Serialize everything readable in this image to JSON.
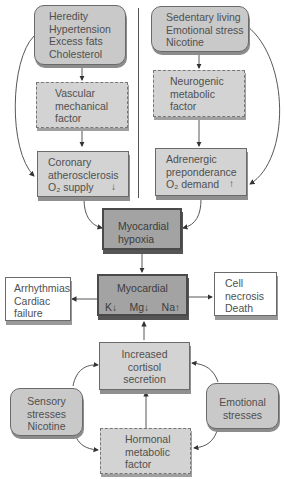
{
  "diagram": {
    "nodes": {
      "heredity": {
        "label": "Heredity\nHypertension\nExcess fats\nCholesterol",
        "style": "rounded"
      },
      "sedentary": {
        "label": "Sedentary living\nEmotional stress\nNicotine",
        "style": "rounded"
      },
      "vascular": {
        "label": "Vascular\nmechanical\nfactor",
        "style": "dashed"
      },
      "neurogenic": {
        "label": "Neurogenic\nmetabolic\nfactor",
        "style": "dashed"
      },
      "coronary": {
        "label": "Coronary\natherosclerosis",
        "line3": "O₂ supply",
        "arrow": "↓",
        "style": "solid"
      },
      "adrenergic": {
        "label": "Adrenergic\npreponderance",
        "line3": "O₂ demand",
        "arrow": "↑",
        "style": "solid"
      },
      "hypoxia": {
        "label": "Myocardial\nhypoxia",
        "style": "dark"
      },
      "myocardial": {
        "label": "Myocardial",
        "ions": [
          {
            "ion": "K",
            "arrow": "↓"
          },
          {
            "ion": "Mg",
            "arrow": "↓"
          },
          {
            "ion": "Na",
            "arrow": "↑"
          }
        ],
        "style": "dark"
      },
      "arrhythmias": {
        "label": "Arrhythmias\nCardiac\nfailure",
        "style": "white"
      },
      "necrosis": {
        "label": "Cell\nnecrosis\nDeath",
        "style": "white"
      },
      "cortisol": {
        "label": "Increased\ncortisol\nsecretion",
        "style": "solid"
      },
      "sensory": {
        "label": "Sensory\nstresses\nNicotine",
        "style": "rounded"
      },
      "emotional": {
        "label": "Emotional\nstresses",
        "style": "rounded"
      },
      "hormonal": {
        "label": "Hormonal\nmetabolic\nfactor",
        "style": "dashed"
      }
    },
    "edges": [
      [
        "heredity",
        "vascular"
      ],
      [
        "heredity",
        "coronary"
      ],
      [
        "vascular",
        "coronary"
      ],
      [
        "sedentary",
        "neurogenic"
      ],
      [
        "sedentary",
        "adrenergic"
      ],
      [
        "neurogenic",
        "adrenergic"
      ],
      [
        "coronary",
        "hypoxia"
      ],
      [
        "adrenergic",
        "hypoxia"
      ],
      [
        "hypoxia",
        "myocardial"
      ],
      [
        "myocardial",
        "arrhythmias"
      ],
      [
        "myocardial",
        "necrosis"
      ],
      [
        "cortisol",
        "myocardial"
      ],
      [
        "hormonal",
        "cortisol"
      ],
      [
        "sensory",
        "cortisol"
      ],
      [
        "sensory",
        "hormonal"
      ],
      [
        "emotional",
        "cortisol"
      ],
      [
        "emotional",
        "hormonal"
      ]
    ]
  }
}
